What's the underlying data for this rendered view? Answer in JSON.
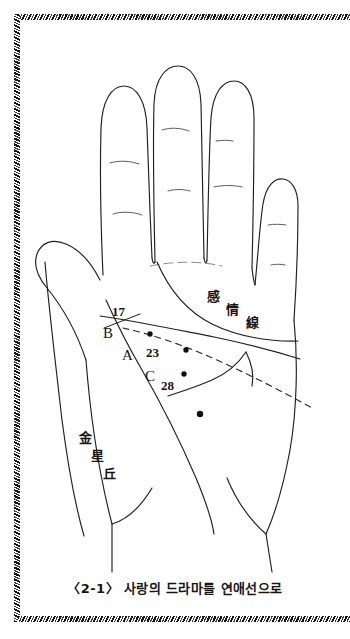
{
  "figure": {
    "caption": "〈2-1〉 사랑의 드라마를 연애선으로",
    "background_color": "#ffffff",
    "ink_color": "#1a1a1a",
    "border_style": "braided-rope",
    "border_sides": [
      "top",
      "left",
      "bottom"
    ]
  },
  "diagram": {
    "hand": "open left palm, fingers up",
    "annotations": {
      "heart_line_label": {
        "text": "感情線",
        "chars": [
          "感",
          "情",
          "線"
        ],
        "meaning_note": "heart line"
      },
      "venus_mount_label": {
        "text": "金星丘",
        "chars": [
          "金",
          "星",
          "丘"
        ],
        "meaning_note": "mount of venus"
      }
    },
    "point_labels": [
      {
        "id": "p17",
        "text": "17",
        "kind": "age-number"
      },
      {
        "id": "pB",
        "text": "B",
        "kind": "letter"
      },
      {
        "id": "pA",
        "text": "A",
        "kind": "letter"
      },
      {
        "id": "p23",
        "text": "23",
        "kind": "age-number"
      },
      {
        "id": "pC",
        "text": "C",
        "kind": "letter"
      },
      {
        "id": "p28",
        "text": "28",
        "kind": "age-number"
      }
    ],
    "markers": [
      {
        "id": "dot-b",
        "label": "17 / B"
      },
      {
        "id": "dot-a",
        "label": "23 / A"
      },
      {
        "id": "dot-c",
        "label": "28 / C"
      },
      {
        "id": "dot-low",
        "label": "lower fate-line point"
      }
    ],
    "lines": [
      {
        "id": "heart-line",
        "style": "solid",
        "name": "감정선 / heart line"
      },
      {
        "id": "head-line",
        "style": "solid",
        "name": "두뇌선 / head line"
      },
      {
        "id": "life-line",
        "style": "solid",
        "name": "생명선 / life line"
      },
      {
        "id": "fate-line",
        "style": "solid",
        "name": "운명선 / fate line"
      },
      {
        "id": "romance-line",
        "style": "dashed",
        "name": "연애선 / romance line"
      }
    ]
  }
}
